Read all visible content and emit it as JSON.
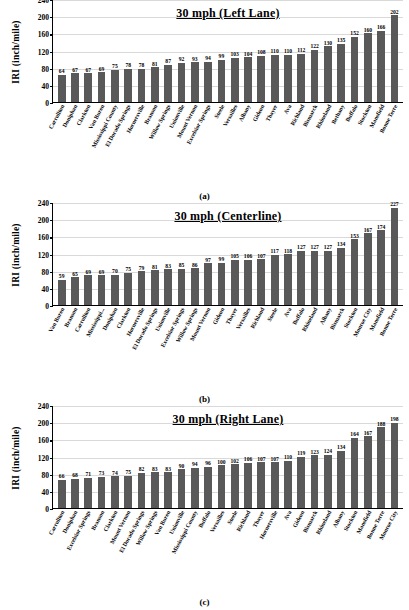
{
  "figure": {
    "axis": {
      "ylabel": "IRI (inch/mile)",
      "yticks": [
        "240",
        "200",
        "160",
        "120",
        "80",
        "40",
        "0"
      ],
      "ymin": 0,
      "ymax": 240
    },
    "bar_color": "#595959"
  },
  "chart_data": [
    {
      "type": "bar",
      "title": "30 mph (Left Lane)",
      "caption": "(a)",
      "xlabel": "",
      "ylabel": "IRI (inch/mile)",
      "ylim": [
        0,
        240
      ],
      "yticks": [
        0,
        40,
        80,
        120,
        160,
        200,
        240
      ],
      "grid": true,
      "legend": "none",
      "categories": [
        "Carrollton",
        "Doniphan",
        "Clarkton",
        "Van Buren",
        "Mississippi County",
        "El Dorado Springs",
        "Hornersville",
        "Branson",
        "Willow Springs",
        "Unionville",
        "Mount Vernon",
        "Excelsior Springs",
        "Steele",
        "Versailles",
        "Albany",
        "Gideon",
        "Thayer",
        "Ava",
        "Richland",
        "Bismarck",
        "Rhineland",
        "Bethany",
        "Buffalo",
        "Stockton",
        "Mansfield",
        "Bonne Terre"
      ],
      "values": [
        64,
        67,
        67,
        69,
        75,
        78,
        78,
        81,
        87,
        92,
        93,
        94,
        99,
        103,
        104,
        108,
        110,
        110,
        112,
        122,
        130,
        135,
        152,
        160,
        166,
        202
      ]
    },
    {
      "type": "bar",
      "title": "30 mph (Centerline)",
      "caption": "(b)",
      "xlabel": "",
      "ylabel": "IRI (inch/mile)",
      "ylim": [
        0,
        240
      ],
      "yticks": [
        0,
        40,
        80,
        120,
        160,
        200,
        240
      ],
      "grid": true,
      "legend": "none",
      "categories": [
        "Van Buren",
        "Branson",
        "Carrollton",
        "Mississippi...",
        "Doniphan",
        "Clarkton",
        "Hornersville",
        "El Dorado Springs",
        "Unionville",
        "Excelsior Springs",
        "Willow Springs",
        "Mount Vernon",
        "Gideon",
        "Thayer",
        "Versailles",
        "Richland",
        "Steele",
        "Ava",
        "Buffalo",
        "Rhineland",
        "Albany",
        "Bismarck",
        "Stockton",
        "Monroe City",
        "Mansfield",
        "Bonne Terre"
      ],
      "values": [
        59,
        65,
        69,
        69,
        70,
        75,
        79,
        81,
        83,
        85,
        86,
        97,
        99,
        105,
        106,
        107,
        117,
        118,
        127,
        127,
        127,
        134,
        153,
        167,
        174,
        227
      ]
    },
    {
      "type": "bar",
      "title": "30 mph (Right Lane)",
      "caption": "(c)",
      "xlabel": "",
      "ylabel": "IRI (inch/mile)",
      "ylim": [
        0,
        240
      ],
      "yticks": [
        0,
        40,
        80,
        120,
        160,
        200,
        240
      ],
      "grid": true,
      "legend": "none",
      "categories": [
        "Carrollton",
        "Doniphan",
        "Excelsior Springs",
        "Branson",
        "Clarkton",
        "Mount Vernon",
        "El Dorado Springs",
        "Willow Springs",
        "Van Buren",
        "Unionville",
        "Mississippi County",
        "Buffalo",
        "Versailles",
        "Steele",
        "Richland",
        "Thayer",
        "Hornersville",
        "Ava",
        "Gideon",
        "Bismarck",
        "Rhineland",
        "Albany",
        "Stockton",
        "Mansfield",
        "Bonne Terre",
        "Monroe City"
      ],
      "values": [
        66,
        68,
        71,
        73,
        74,
        75,
        82,
        83,
        83,
        90,
        94,
        96,
        100,
        102,
        106,
        107,
        107,
        110,
        119,
        123,
        124,
        134,
        164,
        167,
        188,
        198
      ]
    }
  ]
}
